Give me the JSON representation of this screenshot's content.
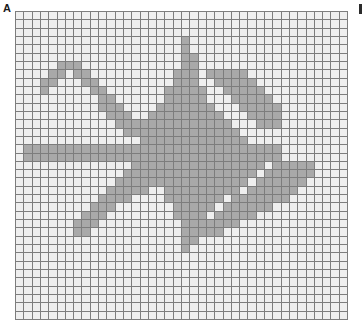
{
  "panel": {
    "label": "A",
    "right_marker": "tick-mark"
  },
  "chart_data": {
    "type": "heatmap",
    "title": "A",
    "xlabel": "",
    "ylabel": "",
    "grid": true,
    "legend_position": "none",
    "columns": 40,
    "rows": 37,
    "colors": {
      "empty": "#efefef",
      "filled": "#a9a9a9",
      "gridline": "#7d7d7d",
      "background": "#ffffff",
      "label": "#1a1a1a"
    },
    "value_labels": {
      "0": "empty stitch",
      "1": "filled stitch"
    },
    "xlim": [
      0,
      40
    ],
    "ylim": [
      0,
      37
    ],
    "values": [
      [
        0,
        0,
        0,
        0,
        0,
        0,
        0,
        0,
        0,
        0,
        0,
        0,
        0,
        0,
        0,
        0,
        0,
        0,
        0,
        0,
        0,
        0,
        0,
        0,
        0,
        0,
        0,
        0,
        0,
        0,
        0,
        0,
        0,
        0,
        0,
        0,
        0,
        0,
        0,
        0
      ],
      [
        0,
        0,
        0,
        0,
        0,
        0,
        0,
        0,
        0,
        0,
        0,
        0,
        0,
        0,
        0,
        0,
        0,
        0,
        0,
        0,
        0,
        0,
        0,
        0,
        0,
        0,
        0,
        0,
        0,
        0,
        0,
        0,
        0,
        0,
        0,
        0,
        0,
        0,
        0,
        0
      ],
      [
        0,
        0,
        0,
        0,
        0,
        0,
        0,
        0,
        0,
        0,
        0,
        0,
        0,
        0,
        0,
        0,
        0,
        0,
        0,
        0,
        0,
        0,
        0,
        0,
        0,
        0,
        0,
        0,
        0,
        0,
        0,
        0,
        0,
        0,
        0,
        0,
        0,
        0,
        0,
        0
      ],
      [
        0,
        0,
        0,
        0,
        0,
        0,
        0,
        0,
        0,
        0,
        0,
        0,
        0,
        0,
        0,
        0,
        0,
        0,
        0,
        0,
        1,
        0,
        0,
        0,
        0,
        0,
        0,
        0,
        0,
        0,
        0,
        0,
        0,
        0,
        0,
        0,
        0,
        0,
        0,
        0
      ],
      [
        0,
        0,
        0,
        0,
        0,
        0,
        0,
        0,
        0,
        0,
        0,
        0,
        0,
        0,
        0,
        0,
        0,
        0,
        0,
        0,
        1,
        0,
        0,
        0,
        0,
        0,
        0,
        0,
        0,
        0,
        0,
        0,
        0,
        0,
        0,
        0,
        0,
        0,
        0,
        0
      ],
      [
        0,
        0,
        0,
        0,
        0,
        0,
        0,
        0,
        0,
        0,
        0,
        0,
        0,
        0,
        0,
        0,
        0,
        0,
        0,
        0,
        1,
        1,
        0,
        0,
        0,
        0,
        0,
        0,
        0,
        0,
        0,
        0,
        0,
        0,
        0,
        0,
        0,
        0,
        0,
        0
      ],
      [
        0,
        0,
        0,
        0,
        0,
        1,
        1,
        1,
        0,
        0,
        0,
        0,
        0,
        0,
        0,
        0,
        0,
        0,
        0,
        0,
        1,
        1,
        0,
        0,
        0,
        0,
        0,
        0,
        0,
        0,
        0,
        0,
        0,
        0,
        0,
        0,
        0,
        0,
        0,
        0
      ],
      [
        0,
        0,
        0,
        0,
        1,
        1,
        0,
        1,
        1,
        0,
        0,
        0,
        0,
        0,
        0,
        0,
        0,
        0,
        0,
        1,
        1,
        1,
        0,
        0,
        0,
        0,
        0,
        0,
        0,
        0,
        0,
        0,
        0,
        0,
        0,
        0,
        0,
        0,
        0,
        0
      ],
      [
        0,
        0,
        0,
        1,
        1,
        0,
        0,
        0,
        1,
        1,
        0,
        0,
        0,
        0,
        0,
        0,
        0,
        0,
        0,
        1,
        1,
        1,
        0,
        0,
        0,
        0,
        0,
        0,
        0,
        0,
        0,
        0,
        0,
        0,
        0,
        0,
        0,
        0,
        0,
        0
      ],
      [
        0,
        0,
        0,
        1,
        0,
        0,
        0,
        0,
        0,
        1,
        1,
        0,
        0,
        0,
        0,
        0,
        0,
        0,
        1,
        1,
        1,
        1,
        1,
        0,
        0,
        0,
        0,
        0,
        0,
        0,
        0,
        0,
        0,
        0,
        0,
        0,
        0,
        0,
        0,
        0
      ],
      [
        0,
        0,
        0,
        0,
        0,
        0,
        0,
        0,
        0,
        0,
        1,
        1,
        0,
        0,
        0,
        0,
        0,
        0,
        1,
        1,
        1,
        1,
        1,
        0,
        0,
        0,
        0,
        0,
        0,
        0,
        0,
        0,
        0,
        0,
        0,
        0,
        0,
        0,
        0,
        0
      ],
      [
        0,
        0,
        0,
        0,
        0,
        0,
        0,
        0,
        0,
        0,
        1,
        1,
        1,
        0,
        0,
        0,
        0,
        1,
        1,
        1,
        1,
        1,
        1,
        1,
        0,
        0,
        0,
        0,
        0,
        0,
        0,
        0,
        0,
        0,
        0,
        0,
        0,
        0,
        0,
        0
      ],
      [
        0,
        0,
        0,
        0,
        0,
        0,
        0,
        0,
        0,
        0,
        0,
        1,
        1,
        1,
        0,
        0,
        1,
        1,
        1,
        1,
        1,
        1,
        1,
        1,
        1,
        0,
        0,
        0,
        0,
        0,
        0,
        0,
        0,
        0,
        0,
        0,
        0,
        0,
        0,
        0
      ],
      [
        0,
        0,
        0,
        0,
        0,
        0,
        0,
        0,
        0,
        0,
        0,
        0,
        1,
        1,
        1,
        1,
        1,
        1,
        1,
        1,
        1,
        1,
        1,
        1,
        1,
        1,
        0,
        0,
        0,
        0,
        0,
        0,
        0,
        0,
        0,
        0,
        0,
        0,
        0,
        0
      ],
      [
        0,
        0,
        0,
        0,
        0,
        0,
        0,
        0,
        0,
        0,
        0,
        0,
        0,
        1,
        1,
        1,
        1,
        1,
        1,
        1,
        1,
        1,
        1,
        1,
        1,
        1,
        1,
        0,
        0,
        0,
        0,
        0,
        0,
        0,
        0,
        0,
        0,
        0,
        0,
        0
      ],
      [
        0,
        0,
        0,
        0,
        0,
        0,
        0,
        0,
        0,
        0,
        0,
        0,
        0,
        0,
        0,
        1,
        1,
        1,
        1,
        1,
        1,
        1,
        1,
        1,
        1,
        1,
        1,
        1,
        0,
        0,
        0,
        0,
        0,
        0,
        0,
        0,
        0,
        0,
        0,
        0
      ],
      [
        0,
        1,
        1,
        1,
        1,
        1,
        1,
        1,
        1,
        1,
        1,
        1,
        1,
        1,
        1,
        1,
        1,
        1,
        1,
        1,
        1,
        1,
        1,
        1,
        1,
        1,
        1,
        1,
        1,
        1,
        1,
        1,
        0,
        0,
        0,
        0,
        0,
        0,
        0,
        0
      ],
      [
        0,
        1,
        1,
        1,
        1,
        1,
        1,
        1,
        1,
        1,
        1,
        1,
        1,
        1,
        1,
        1,
        1,
        1,
        1,
        1,
        1,
        1,
        1,
        1,
        1,
        1,
        1,
        1,
        1,
        1,
        1,
        1,
        0,
        0,
        0,
        0,
        0,
        0,
        0,
        0
      ],
      [
        0,
        0,
        0,
        0,
        0,
        0,
        0,
        0,
        0,
        0,
        0,
        0,
        0,
        0,
        1,
        1,
        1,
        1,
        1,
        1,
        1,
        1,
        1,
        1,
        1,
        1,
        1,
        1,
        1,
        1,
        0,
        0,
        0,
        0,
        0,
        0,
        0,
        0,
        0,
        0
      ],
      [
        0,
        0,
        0,
        0,
        0,
        0,
        0,
        0,
        0,
        0,
        0,
        0,
        0,
        1,
        1,
        1,
        1,
        1,
        1,
        1,
        1,
        1,
        1,
        1,
        1,
        1,
        1,
        1,
        1,
        0,
        0,
        0,
        0,
        0,
        0,
        0,
        0,
        0,
        0,
        0
      ],
      [
        0,
        0,
        0,
        0,
        0,
        0,
        0,
        0,
        0,
        0,
        0,
        0,
        1,
        1,
        1,
        1,
        1,
        1,
        1,
        1,
        1,
        1,
        1,
        1,
        1,
        1,
        1,
        1,
        0,
        0,
        0,
        0,
        0,
        0,
        0,
        0,
        0,
        0,
        0,
        0
      ],
      [
        0,
        0,
        0,
        0,
        0,
        0,
        0,
        0,
        0,
        0,
        0,
        1,
        1,
        1,
        1,
        1,
        0,
        0,
        1,
        1,
        1,
        1,
        1,
        1,
        1,
        1,
        1,
        0,
        0,
        0,
        0,
        0,
        0,
        0,
        0,
        0,
        0,
        0,
        0,
        0
      ],
      [
        0,
        0,
        0,
        0,
        0,
        0,
        0,
        0,
        0,
        0,
        1,
        1,
        1,
        1,
        0,
        0,
        0,
        0,
        1,
        1,
        1,
        1,
        1,
        1,
        1,
        0,
        0,
        0,
        0,
        0,
        0,
        0,
        0,
        0,
        0,
        0,
        0,
        0,
        0,
        0
      ],
      [
        0,
        0,
        0,
        0,
        0,
        0,
        0,
        0,
        0,
        1,
        1,
        1,
        0,
        0,
        0,
        0,
        0,
        0,
        0,
        1,
        1,
        1,
        1,
        1,
        0,
        0,
        0,
        0,
        0,
        0,
        0,
        0,
        0,
        0,
        0,
        0,
        0,
        0,
        0,
        0
      ],
      [
        0,
        0,
        0,
        0,
        0,
        0,
        0,
        0,
        1,
        1,
        1,
        0,
        0,
        0,
        0,
        0,
        0,
        0,
        0,
        1,
        1,
        1,
        1,
        0,
        0,
        0,
        0,
        0,
        0,
        0,
        0,
        0,
        0,
        0,
        0,
        0,
        0,
        0,
        0,
        0
      ],
      [
        0,
        0,
        0,
        0,
        0,
        0,
        0,
        1,
        1,
        1,
        0,
        0,
        0,
        0,
        0,
        0,
        0,
        0,
        0,
        0,
        1,
        1,
        1,
        0,
        0,
        0,
        0,
        0,
        0,
        0,
        0,
        0,
        0,
        0,
        0,
        0,
        0,
        0,
        0,
        0
      ],
      [
        0,
        0,
        0,
        0,
        0,
        0,
        0,
        1,
        1,
        0,
        0,
        0,
        0,
        0,
        0,
        0,
        0,
        0,
        0,
        0,
        1,
        1,
        0,
        0,
        0,
        0,
        0,
        0,
        0,
        0,
        0,
        0,
        0,
        0,
        0,
        0,
        0,
        0,
        0,
        0
      ],
      [
        0,
        0,
        0,
        0,
        0,
        0,
        0,
        0,
        0,
        0,
        0,
        0,
        0,
        0,
        0,
        0,
        0,
        0,
        0,
        0,
        1,
        1,
        0,
        0,
        0,
        0,
        0,
        0,
        0,
        0,
        0,
        0,
        0,
        0,
        0,
        0,
        0,
        0,
        0,
        0
      ],
      [
        0,
        0,
        0,
        0,
        0,
        0,
        0,
        0,
        0,
        0,
        0,
        0,
        0,
        0,
        0,
        0,
        0,
        0,
        0,
        0,
        1,
        0,
        0,
        0,
        0,
        0,
        0,
        0,
        0,
        0,
        0,
        0,
        0,
        0,
        0,
        0,
        0,
        0,
        0,
        0
      ],
      [
        0,
        0,
        0,
        0,
        0,
        0,
        0,
        0,
        0,
        0,
        0,
        0,
        0,
        0,
        0,
        0,
        0,
        0,
        0,
        0,
        0,
        0,
        0,
        0,
        0,
        0,
        0,
        0,
        0,
        0,
        0,
        0,
        0,
        0,
        0,
        0,
        0,
        0,
        0,
        0
      ],
      [
        0,
        0,
        0,
        0,
        0,
        0,
        0,
        0,
        0,
        0,
        0,
        0,
        0,
        0,
        0,
        0,
        0,
        0,
        0,
        0,
        0,
        0,
        0,
        0,
        0,
        0,
        0,
        0,
        0,
        0,
        0,
        0,
        0,
        0,
        0,
        0,
        0,
        0,
        0,
        0
      ],
      [
        0,
        0,
        0,
        0,
        0,
        0,
        0,
        0,
        0,
        0,
        0,
        0,
        0,
        0,
        0,
        0,
        0,
        0,
        0,
        0,
        0,
        0,
        0,
        0,
        0,
        0,
        0,
        0,
        0,
        0,
        0,
        0,
        0,
        0,
        0,
        0,
        0,
        0,
        0,
        0
      ],
      [
        0,
        0,
        0,
        0,
        0,
        0,
        0,
        0,
        0,
        0,
        0,
        0,
        0,
        0,
        0,
        0,
        0,
        0,
        0,
        0,
        0,
        0,
        0,
        0,
        0,
        0,
        0,
        0,
        0,
        0,
        0,
        0,
        0,
        0,
        0,
        0,
        0,
        0,
        0,
        0
      ],
      [
        0,
        0,
        0,
        0,
        0,
        0,
        0,
        0,
        0,
        0,
        0,
        0,
        0,
        0,
        0,
        0,
        0,
        0,
        0,
        0,
        0,
        0,
        0,
        0,
        0,
        0,
        0,
        0,
        0,
        0,
        0,
        0,
        0,
        0,
        0,
        0,
        0,
        0,
        0,
        0
      ],
      [
        0,
        0,
        0,
        0,
        0,
        0,
        0,
        0,
        0,
        0,
        0,
        0,
        0,
        0,
        0,
        0,
        0,
        0,
        0,
        0,
        0,
        0,
        0,
        0,
        0,
        0,
        0,
        0,
        0,
        0,
        0,
        0,
        0,
        0,
        0,
        0,
        0,
        0,
        0,
        0
      ],
      [
        0,
        0,
        0,
        0,
        0,
        0,
        0,
        0,
        0,
        0,
        0,
        0,
        0,
        0,
        0,
        0,
        0,
        0,
        0,
        0,
        0,
        0,
        0,
        0,
        0,
        0,
        0,
        0,
        0,
        0,
        0,
        0,
        0,
        0,
        0,
        0,
        0,
        0,
        0,
        0
      ],
      [
        0,
        0,
        0,
        0,
        0,
        0,
        0,
        0,
        0,
        0,
        0,
        0,
        0,
        0,
        0,
        0,
        0,
        0,
        0,
        0,
        0,
        0,
        0,
        0,
        0,
        0,
        0,
        0,
        0,
        0,
        0,
        0,
        0,
        0,
        0,
        0,
        0,
        0,
        0,
        0
      ]
    ],
    "overlay_values": [
      {
        "row": 7,
        "cols": [
          23,
          24,
          25,
          26,
          27
        ]
      },
      {
        "row": 8,
        "cols": [
          24,
          25,
          26,
          27,
          28
        ]
      },
      {
        "row": 9,
        "cols": [
          25,
          26,
          27,
          28,
          29
        ]
      },
      {
        "row": 10,
        "cols": [
          26,
          27,
          28,
          29,
          30
        ]
      },
      {
        "row": 11,
        "cols": [
          27,
          28,
          29,
          30,
          31
        ]
      },
      {
        "row": 12,
        "cols": [
          28,
          29,
          30,
          31
        ]
      },
      {
        "row": 13,
        "cols": [
          29,
          30,
          31
        ]
      },
      {
        "row": 18,
        "cols": [
          31,
          32,
          33,
          34,
          35
        ]
      },
      {
        "row": 19,
        "cols": [
          30,
          31,
          32,
          33,
          34,
          35
        ]
      },
      {
        "row": 20,
        "cols": [
          29,
          30,
          31,
          32,
          33,
          34
        ]
      },
      {
        "row": 21,
        "cols": [
          28,
          29,
          30,
          31,
          32,
          33
        ]
      },
      {
        "row": 22,
        "cols": [
          26,
          27,
          28,
          29,
          30,
          31,
          32
        ]
      },
      {
        "row": 23,
        "cols": [
          25,
          26,
          27,
          28,
          29,
          30
        ]
      },
      {
        "row": 24,
        "cols": [
          24,
          25,
          26,
          27,
          28
        ]
      },
      {
        "row": 25,
        "cols": [
          23,
          24,
          25,
          26
        ]
      },
      {
        "row": 26,
        "cols": [
          22,
          23,
          24
        ]
      }
    ]
  }
}
